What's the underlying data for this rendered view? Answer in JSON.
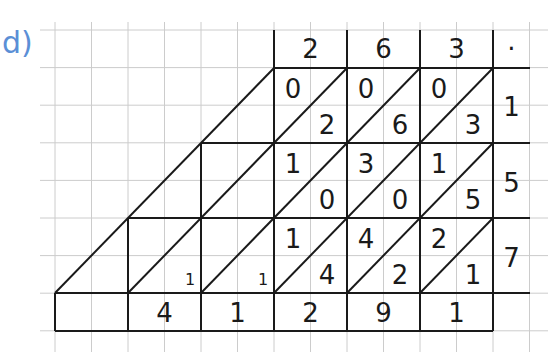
{
  "problem_label": "d)",
  "colors": {
    "label": "#5b8fd6",
    "grid": "#cccccc",
    "lines": "#1a1a1a"
  },
  "multiplicand_digits": [
    "2",
    "6",
    "3"
  ],
  "multiplicand_end_mark": "·",
  "multiplier_digits": [
    "1",
    "5",
    "7"
  ],
  "lattice": [
    [
      {
        "tens": "0",
        "ones": "2"
      },
      {
        "tens": "0",
        "ones": "6"
      },
      {
        "tens": "0",
        "ones": "3"
      }
    ],
    [
      {
        "tens": "1",
        "ones": "0"
      },
      {
        "tens": "3",
        "ones": "0"
      },
      {
        "tens": "1",
        "ones": "5"
      }
    ],
    [
      {
        "tens": "1",
        "ones": "4"
      },
      {
        "tens": "4",
        "ones": "2"
      },
      {
        "tens": "2",
        "ones": "1"
      }
    ]
  ],
  "carries": [
    "1",
    "1"
  ],
  "result_digits": [
    "",
    "4",
    "1",
    "2",
    "9",
    "1"
  ]
}
